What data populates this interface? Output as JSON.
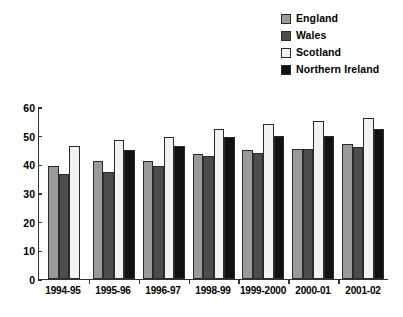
{
  "legend": {
    "items": [
      {
        "label": "England",
        "color": "#9a9a9a"
      },
      {
        "label": "Wales",
        "color": "#4d4d4d"
      },
      {
        "label": "Scotland",
        "color": "#f2f2f2"
      },
      {
        "label": "Northern Ireland",
        "color": "#111111"
      }
    ]
  },
  "axis": {
    "y_ticks": [
      "60",
      "50",
      "40",
      "30",
      "20",
      "10",
      "0"
    ]
  },
  "chart_data": {
    "type": "bar",
    "title": "",
    "xlabel": "",
    "ylabel": "",
    "ylim": [
      0,
      60
    ],
    "grid": false,
    "legend_position": "top-right",
    "categories": [
      "1994-95",
      "1995-96",
      "1996-97",
      "1998-99",
      "1999-2000",
      "2000-01",
      "2001-02"
    ],
    "series": [
      {
        "name": "England",
        "color": "#9a9a9a",
        "values": [
          39.5,
          41,
          41,
          43.5,
          45,
          45.5,
          47
        ]
      },
      {
        "name": "Wales",
        "color": "#4d4d4d",
        "values": [
          36.5,
          37.5,
          39.5,
          43,
          44,
          45.5,
          46
        ]
      },
      {
        "name": "Scotland",
        "color": "#f2f2f2",
        "values": [
          46.5,
          48.5,
          49.5,
          52.5,
          54,
          55,
          56
        ]
      },
      {
        "name": "Northern Ireland",
        "color": "#111111",
        "values": [
          null,
          45,
          46.5,
          49.5,
          50,
          50,
          52.5
        ]
      }
    ]
  }
}
